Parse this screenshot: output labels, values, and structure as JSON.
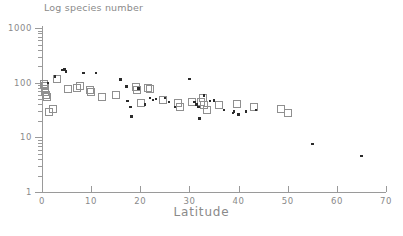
{
  "chart_data": {
    "type": "scatter",
    "title": "Log species number",
    "xlabel": "Latitude",
    "ylabel": "",
    "xlim": [
      0,
      70
    ],
    "ylim": [
      1,
      1000
    ],
    "yscale": "log",
    "xscale": "linear",
    "grid": false,
    "legend": "none",
    "xticks": [
      0,
      10,
      20,
      30,
      40,
      50,
      60,
      70
    ],
    "xtick_labels": [
      "0",
      "10",
      "20",
      "30",
      "40",
      "50",
      "60",
      "70"
    ],
    "yticks": [
      1,
      10,
      100,
      1000
    ],
    "ytick_labels": [
      "1",
      "10",
      "100",
      "1000"
    ],
    "series": [
      {
        "name": "open-squares",
        "marker": "open-square",
        "color": "#8f8f8f",
        "points": [
          [
            0.2,
            95
          ],
          [
            0.4,
            88
          ],
          [
            0.5,
            78
          ],
          [
            0.6,
            70
          ],
          [
            0.8,
            62
          ],
          [
            1.0,
            55
          ],
          [
            1.4,
            30
          ],
          [
            2.2,
            34
          ],
          [
            3.0,
            120
          ],
          [
            5.2,
            80
          ],
          [
            7.0,
            82
          ],
          [
            7.6,
            90
          ],
          [
            9.6,
            76
          ],
          [
            9.9,
            70
          ],
          [
            12.0,
            55
          ],
          [
            15.0,
            62
          ],
          [
            19.0,
            86
          ],
          [
            19.2,
            74
          ],
          [
            20.0,
            44
          ],
          [
            21.5,
            82
          ],
          [
            21.8,
            80
          ],
          [
            24.5,
            50
          ],
          [
            27.5,
            44
          ],
          [
            28.0,
            36
          ],
          [
            30.5,
            46
          ],
          [
            32.2,
            46
          ],
          [
            32.6,
            54
          ],
          [
            32.8,
            40
          ],
          [
            33.4,
            33
          ],
          [
            36.0,
            40
          ],
          [
            39.5,
            42
          ],
          [
            43.0,
            36
          ],
          [
            48.5,
            34
          ],
          [
            50.0,
            28
          ]
        ]
      },
      {
        "name": "filled-dots",
        "marker": "dot",
        "color": "#2b2b2b",
        "points": [
          [
            1.2,
            100
          ],
          [
            2.6,
            130
          ],
          [
            4.0,
            170
          ],
          [
            4.6,
            175
          ],
          [
            4.9,
            160
          ],
          [
            8.4,
            150
          ],
          [
            11.0,
            150
          ],
          [
            16.0,
            115
          ],
          [
            17.2,
            85
          ],
          [
            17.4,
            46
          ],
          [
            18.0,
            36
          ],
          [
            18.2,
            24
          ],
          [
            19.6,
            78
          ],
          [
            21.0,
            40
          ],
          [
            22.0,
            52
          ],
          [
            22.6,
            48
          ],
          [
            23.2,
            50
          ],
          [
            25.0,
            52
          ],
          [
            25.8,
            44
          ],
          [
            27.0,
            36
          ],
          [
            30.0,
            118
          ],
          [
            31.0,
            44
          ],
          [
            31.4,
            40
          ],
          [
            31.8,
            36
          ],
          [
            32.0,
            22
          ],
          [
            33.0,
            58
          ],
          [
            34.2,
            46
          ],
          [
            35.0,
            47
          ],
          [
            37.0,
            32
          ],
          [
            38.8,
            28
          ],
          [
            39.0,
            30
          ],
          [
            40.0,
            26
          ],
          [
            41.5,
            30
          ],
          [
            43.5,
            32
          ],
          [
            55.0,
            7.5
          ],
          [
            65.0,
            4.6
          ]
        ]
      }
    ]
  },
  "axis": {
    "title": "Latitude",
    "y_title": "Log species number"
  }
}
